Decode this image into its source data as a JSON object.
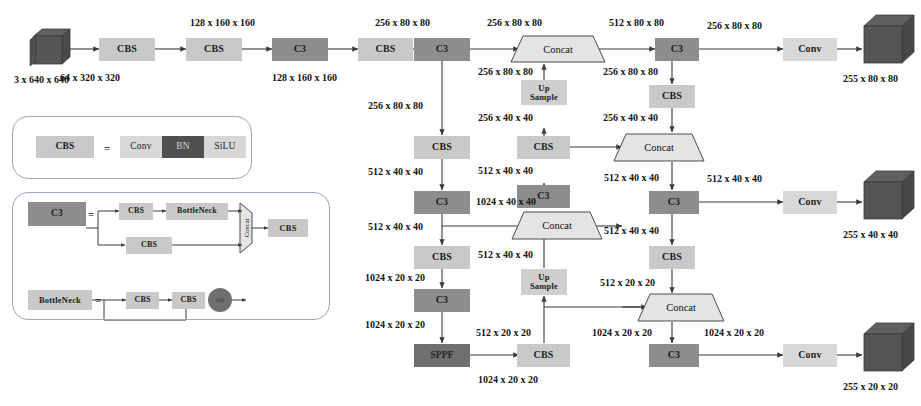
{
  "diagram": {
    "colors": {
      "box_light": "#c9c9c9",
      "box_mid": "#a8a8a8",
      "box_dark": "#8d8d8d",
      "box_darker": "#6f6f6f",
      "box_conv": "#d8d8d8",
      "box_bn": "#4f4f4f",
      "panel_border": "#9aa7c7",
      "arrow": "#3a3a3a",
      "cube_face": "#4d4d4d"
    }
  },
  "input": {
    "cube_label": "3 x 640 x 640"
  },
  "backbone": {
    "nodes": [
      {
        "id": "cbs1",
        "label": "CBS"
      },
      {
        "id": "cbs2",
        "label": "CBS"
      },
      {
        "id": "c3_1",
        "label": "C3"
      },
      {
        "id": "cbs3",
        "label": "CBS"
      },
      {
        "id": "c3_2",
        "label": "C3"
      },
      {
        "id": "cbs4",
        "label": "CBS"
      },
      {
        "id": "c3_3",
        "label": "C3"
      },
      {
        "id": "cbs5",
        "label": "CBS"
      },
      {
        "id": "c3_4",
        "label": "C3"
      },
      {
        "id": "sppf",
        "label": "SPPF"
      }
    ],
    "labels": [
      "64 x 320 x 320",
      "128 x 160 x 160",
      "128 x 160 x 160",
      "256 x 80 x 80",
      "256 x 80 x 80",
      "512 x 40 x 40",
      "512 x 40 x 40",
      "1024 x 20 x 20",
      "1024 x 20 x 20"
    ]
  },
  "neck": {
    "nodes": [
      {
        "id": "concat_top",
        "label": "Concat"
      },
      {
        "id": "upsample_top",
        "line1": "Up",
        "line2": "Sample"
      },
      {
        "id": "cbs_mid1",
        "label": "CBS"
      },
      {
        "id": "c3_mid1",
        "label": "C3"
      },
      {
        "id": "concat_mid",
        "label": "Concat"
      },
      {
        "id": "upsample_bot",
        "line1": "Up",
        "line2": "Sample"
      },
      {
        "id": "cbs_bot",
        "label": "CBS"
      },
      {
        "id": "concat_r_mid",
        "label": "Concat"
      },
      {
        "id": "concat_r_bot",
        "label": "Concat"
      },
      {
        "id": "c3_head_top",
        "label": "C3"
      },
      {
        "id": "cbs_head_top",
        "label": "CBS"
      },
      {
        "id": "c3_head_mid",
        "label": "C3"
      },
      {
        "id": "cbs_head_mid",
        "label": "CBS"
      },
      {
        "id": "c3_head_bot",
        "label": "C3"
      }
    ],
    "labels": [
      "256 x 80 x 80",
      "512 x 80 x 80",
      "256 x 80 x 80",
      "256 x 80 x 80",
      "256 x 40 x 40",
      "256 x 40 x 40",
      "512 x 40 x 40",
      "1024 x 40 x 40",
      "512 x 40 x 40",
      "512 x 40 x 40",
      "512 x 40 x 40",
      "512 x 20 x 20",
      "512 x 20 x 20",
      "1024 x 20 x 20",
      "1024 x 20 x 20",
      "256 x 80 x 80",
      "256 x 80 x 80"
    ]
  },
  "heads": [
    {
      "conv_label": "Conv",
      "in_label": "256 x 80 x 80",
      "out_label": "255 x 80 x 80"
    },
    {
      "conv_label": "Conv",
      "in_label": "512 x 40 x 40",
      "out_label": "255 x 40 x 40"
    },
    {
      "conv_label": "Conv",
      "in_label": "1024 x 20 x 20",
      "out_label": "255 x 20 x 20"
    }
  ],
  "legend": {
    "cbs": {
      "name": "CBS",
      "equals": "=",
      "parts": [
        "Conv",
        "BN",
        "SiLU"
      ]
    },
    "c3": {
      "name": "C3",
      "equals": "=",
      "branch_top": [
        "CBS",
        "BottleNeck"
      ],
      "branch_bottom": [
        "CBS"
      ],
      "concat": "Concat",
      "output": "CBS"
    },
    "bottleneck": {
      "name": "BottleNeck",
      "equals": "=",
      "parts": [
        "CBS",
        "CBS"
      ],
      "add": "add"
    }
  }
}
